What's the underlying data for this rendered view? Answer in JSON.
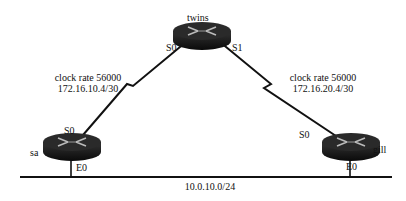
{
  "diagram": {
    "routers": [
      {
        "id": "twins",
        "name": "twins",
        "interfaces": [
          "S0",
          "S1"
        ]
      },
      {
        "id": "sa",
        "name": "sa",
        "interfaces": [
          "S0",
          "E0"
        ]
      },
      {
        "id": "gill",
        "name": "gill",
        "interfaces": [
          "S0",
          "E0"
        ]
      }
    ],
    "links": [
      {
        "from": "twins S0",
        "to": "sa S0",
        "type": "serial",
        "clock_rate": "clock rate 56000",
        "network": "172.16.10.4/30"
      },
      {
        "from": "twins S1",
        "to": "gill S0",
        "type": "serial",
        "clock_rate": "clock rate 56000",
        "network": "172.16.20.4/30"
      },
      {
        "from": "sa E0",
        "to": "gill E0",
        "type": "ethernet",
        "network": "10.0.10.0/24"
      }
    ],
    "labels": {
      "twins": "twins",
      "twins_s0": "S0",
      "twins_s1": "S1",
      "sa": "sa",
      "sa_s0": "S0",
      "sa_e0": "E0",
      "gill": "gill",
      "gill_s0": "S0",
      "gill_e0": "E0",
      "link1_clock": "clock rate 56000",
      "link1_net": "172.16.10.4/30",
      "link2_clock": "clock rate 56000",
      "link2_net": "172.16.20.4/30",
      "lan_net": "10.0.10.0/24"
    }
  }
}
